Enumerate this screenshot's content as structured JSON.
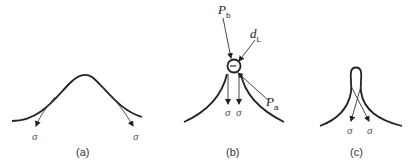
{
  "figure": {
    "panels": [
      {
        "id": "a",
        "caption": "(a)",
        "stress_labels": [
          "σ",
          "σ"
        ]
      },
      {
        "id": "b",
        "caption": "(b)",
        "stress_labels": [
          "σ",
          "σ"
        ],
        "labels": {
          "pb_main": "P",
          "pb_sub": "b",
          "dl_main": "d",
          "dl_sub": "L",
          "pa_main": "P",
          "pa_sub": "a"
        }
      },
      {
        "id": "c",
        "caption": "(c)",
        "stress_labels": [
          "σ",
          "σ"
        ]
      }
    ]
  }
}
